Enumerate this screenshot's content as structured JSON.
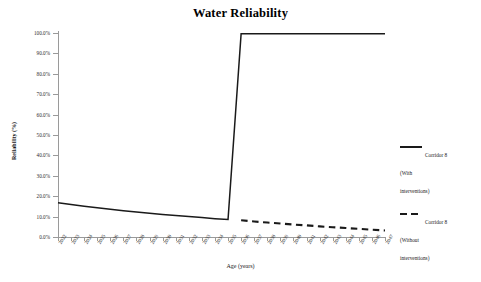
{
  "chart_data": {
    "type": "line",
    "title": "Water Reliability",
    "xlabel": "Age (years)",
    "ylabel": "Reliability (%)",
    "ylim": [
      0,
      100
    ],
    "ytick_labels": [
      "100.0%",
      "90.0%",
      "80.0%",
      "70.0%",
      "60.0%",
      "50.0%",
      "40.0%",
      "30.0%",
      "20.0%",
      "10.0%",
      "0.0%"
    ],
    "ytick_values": [
      100,
      90,
      80,
      70,
      60,
      50,
      40,
      30,
      20,
      10,
      0
    ],
    "grid": false,
    "legend_position": "right",
    "categories": [
      "2022",
      "2023",
      "2024",
      "2025",
      "2026",
      "2027",
      "2028",
      "2029",
      "2030",
      "2031",
      "2032",
      "2033",
      "2034",
      "2035",
      "2036",
      "2037",
      "2038",
      "2039",
      "2040",
      "2041",
      "2042",
      "2043",
      "2044",
      "2045",
      "2046",
      "2047"
    ],
    "series": [
      {
        "name": "Corridor 8 (With interventions)",
        "style": "solid",
        "color": "#1a1a1a",
        "values": [
          16.8,
          15.9,
          15.1,
          14.3,
          13.6,
          12.9,
          12.2,
          11.6,
          11.0,
          10.5,
          10.0,
          9.5,
          9.0,
          8.6,
          99.6,
          99.6,
          99.6,
          99.6,
          99.6,
          99.6,
          99.6,
          99.6,
          99.6,
          99.6,
          99.6,
          99.6
        ]
      },
      {
        "name": "Corridor 8 (Without interventions)",
        "style": "dashed",
        "color": "#1a1a1a",
        "values": [
          null,
          null,
          null,
          null,
          null,
          null,
          null,
          null,
          null,
          null,
          null,
          null,
          null,
          null,
          8.2,
          7.6,
          7.1,
          6.6,
          6.1,
          5.7,
          5.2,
          4.8,
          4.4,
          4.0,
          3.6,
          3.2
        ]
      }
    ]
  },
  "legend": {
    "items": [
      {
        "label": "Corridor 8\n(With\ninterventions)",
        "style": "solid"
      },
      {
        "label": "Corridor 8\n(Without\ninterventions)",
        "style": "dashed"
      }
    ]
  }
}
